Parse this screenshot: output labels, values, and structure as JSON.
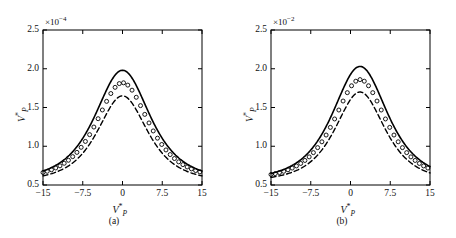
{
  "figure": {
    "background": "#ffffff",
    "line_color": "#000000"
  },
  "chart_data": [
    {
      "type": "line",
      "panel": "(a)",
      "title": "",
      "xlabel": "V*P",
      "ylabel": "V*P",
      "y_exponent_label": "×10",
      "y_exponent_power": "−4",
      "xlim": [
        -15,
        15
      ],
      "ylim": [
        0.5,
        2.5
      ],
      "xticks": [
        -15,
        -7.5,
        0,
        7.5,
        15
      ],
      "xtick_labels": [
        "−15",
        "−7.5",
        "0",
        "7.5",
        "15"
      ],
      "yticks": [
        0.5,
        1.0,
        1.5,
        2.0,
        2.5
      ],
      "ytick_labels": [
        "0.5",
        "1.0",
        "1.5",
        "2.0",
        "2.5"
      ],
      "grid": false,
      "legend": "none",
      "series": [
        {
          "name": "solid-curve",
          "style": "solid",
          "peak_x": 0.0,
          "peak_y": 1.98,
          "baseline": 0.55,
          "half_width": 6.6,
          "x": [
            -15,
            -13.5,
            -12,
            -10.5,
            -9,
            -7.5,
            -6,
            -4.5,
            -3,
            -1.5,
            0,
            1.5,
            3,
            4.5,
            6,
            7.5,
            9,
            10.5,
            12,
            13.5,
            15
          ],
          "values": [
            0.64,
            0.69,
            0.75,
            0.83,
            0.93,
            1.06,
            1.23,
            1.45,
            1.68,
            1.88,
            1.98,
            1.88,
            1.68,
            1.45,
            1.23,
            1.06,
            0.93,
            0.83,
            0.75,
            0.69,
            0.64
          ]
        },
        {
          "name": "circle-markers",
          "style": "circles",
          "peak_x": 0.0,
          "peak_y": 1.82,
          "baseline": 0.56,
          "half_width": 6.3,
          "x": [
            -15,
            -13.5,
            -12,
            -10.5,
            -9,
            -7.5,
            -6,
            -4.5,
            -3,
            -1.5,
            0,
            1.5,
            3,
            4.5,
            6,
            7.5,
            9,
            10.5,
            12,
            13.5,
            15
          ],
          "values": [
            0.66,
            0.7,
            0.76,
            0.83,
            0.92,
            1.04,
            1.2,
            1.4,
            1.6,
            1.76,
            1.82,
            1.76,
            1.6,
            1.4,
            1.2,
            1.04,
            0.92,
            0.83,
            0.76,
            0.7,
            0.66
          ]
        },
        {
          "name": "dashed-curve",
          "style": "dashed",
          "peak_x": 0.0,
          "peak_y": 1.65,
          "baseline": 0.54,
          "half_width": 6.0,
          "x": [
            -15,
            -13.5,
            -12,
            -10.5,
            -9,
            -7.5,
            -6,
            -4.5,
            -3,
            -1.5,
            0,
            1.5,
            3,
            4.5,
            6,
            7.5,
            9,
            10.5,
            12,
            13.5,
            15
          ],
          "values": [
            0.62,
            0.66,
            0.71,
            0.78,
            0.86,
            0.97,
            1.12,
            1.3,
            1.48,
            1.61,
            1.65,
            1.61,
            1.48,
            1.3,
            1.12,
            0.97,
            0.86,
            0.78,
            0.71,
            0.66,
            0.62
          ]
        }
      ]
    },
    {
      "type": "line",
      "panel": "(b)",
      "title": "",
      "xlabel": "V*P",
      "ylabel": "V*P",
      "y_exponent_label": "×10",
      "y_exponent_power": "−2",
      "xlim": [
        -15,
        15
      ],
      "ylim": [
        0.5,
        2.5
      ],
      "xticks": [
        -15,
        -7.5,
        0,
        7.5,
        15
      ],
      "xtick_labels": [
        "−15",
        "−7.5",
        "0",
        "7.5",
        "15"
      ],
      "yticks": [
        0.5,
        1.0,
        1.5,
        2.0,
        2.5
      ],
      "ytick_labels": [
        "0.5",
        "1.0",
        "1.5",
        "2.0",
        "2.5"
      ],
      "grid": false,
      "legend": "none",
      "series": [
        {
          "name": "solid-curve",
          "style": "solid",
          "peak_x": 1.8,
          "peak_y": 2.03,
          "baseline": 0.55,
          "half_width": 6.6,
          "x": [
            -15,
            -13.5,
            -12,
            -10.5,
            -9,
            -7.5,
            -6,
            -4.5,
            -3,
            -1.5,
            0,
            1.5,
            3,
            4.5,
            6,
            7.5,
            9,
            10.5,
            12,
            13.5,
            15
          ],
          "values": [
            0.63,
            0.67,
            0.72,
            0.79,
            0.88,
            0.99,
            1.15,
            1.36,
            1.6,
            1.84,
            1.99,
            2.03,
            1.95,
            1.77,
            1.53,
            1.31,
            1.13,
            0.99,
            0.89,
            0.81,
            0.75
          ]
        },
        {
          "name": "circle-markers",
          "style": "circles",
          "peak_x": 1.8,
          "peak_y": 1.86,
          "baseline": 0.56,
          "half_width": 6.3,
          "x": [
            -15,
            -13.5,
            -12,
            -10.5,
            -9,
            -7.5,
            -6,
            -4.5,
            -3,
            -1.5,
            0,
            1.5,
            3,
            4.5,
            6,
            7.5,
            9,
            10.5,
            12,
            13.5,
            15
          ],
          "values": [
            0.65,
            0.69,
            0.74,
            0.8,
            0.88,
            0.99,
            1.13,
            1.32,
            1.54,
            1.74,
            1.84,
            1.86,
            1.78,
            1.62,
            1.42,
            1.23,
            1.08,
            0.96,
            0.87,
            0.8,
            0.74
          ]
        },
        {
          "name": "dashed-curve",
          "style": "dashed",
          "peak_x": 1.8,
          "peak_y": 1.7,
          "baseline": 0.54,
          "half_width": 6.0,
          "x": [
            -15,
            -13.5,
            -12,
            -10.5,
            -9,
            -7.5,
            -6,
            -4.5,
            -3,
            -1.5,
            0,
            1.5,
            3,
            4.5,
            6,
            7.5,
            9,
            10.5,
            12,
            13.5,
            15
          ],
          "values": [
            0.61,
            0.65,
            0.7,
            0.76,
            0.84,
            0.94,
            1.08,
            1.26,
            1.45,
            1.62,
            1.69,
            1.7,
            1.63,
            1.49,
            1.31,
            1.14,
            1.0,
            0.9,
            0.82,
            0.76,
            0.71
          ]
        }
      ]
    }
  ]
}
